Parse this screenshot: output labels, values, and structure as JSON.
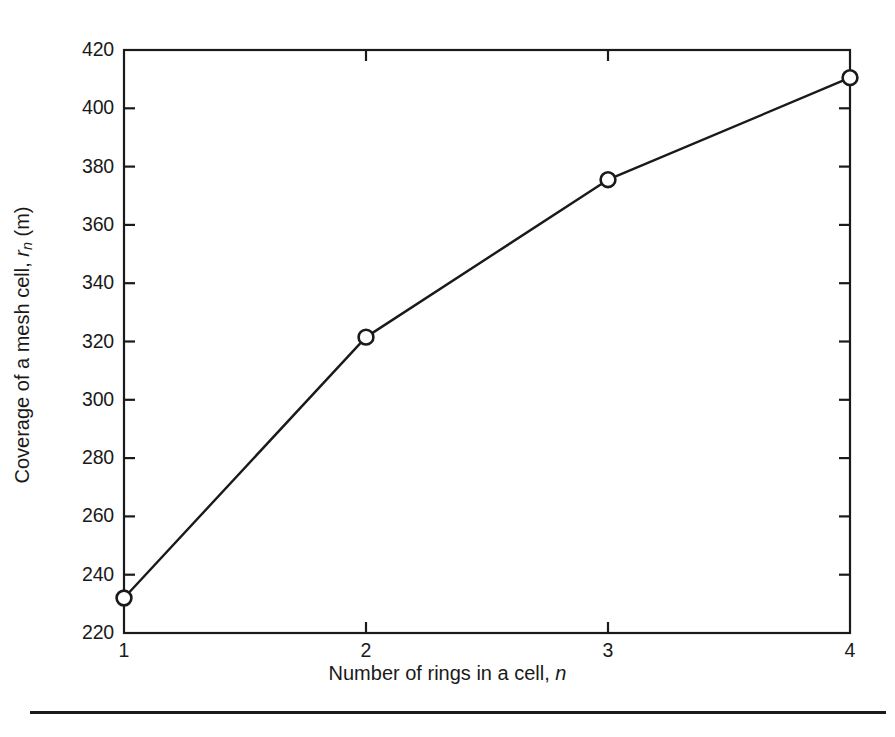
{
  "figure": {
    "background_color": "#ffffff",
    "ink_color": "#1a1a1a",
    "has_bottom_rule": true
  },
  "chart_data": {
    "type": "line",
    "title": "",
    "subtitle": "",
    "xlabel": "Number of rings in a cell, n",
    "xlabel_parts": {
      "text": "Number of rings in a cell, ",
      "variable": "n"
    },
    "ylabel": "Coverage of a mesh cell, r_n (m)",
    "ylabel_parts": {
      "text": "Coverage of a mesh cell, ",
      "variable": "r",
      "subscript": "n",
      "units": " (m)"
    },
    "x": [
      1,
      2,
      3,
      4
    ],
    "values": [
      232,
      321.5,
      375.5,
      410.5
    ],
    "series": [
      {
        "name": "Coverage of a mesh cell",
        "x": [
          1,
          2,
          3,
          4
        ],
        "values": [
          232,
          321.5,
          375.5,
          410.5
        ]
      }
    ],
    "xlim": [
      1,
      4
    ],
    "ylim": [
      220,
      420
    ],
    "xticks": [
      1,
      2,
      3,
      4
    ],
    "xtick_labels": [
      "1",
      "2",
      "3",
      "4"
    ],
    "yticks": [
      220,
      240,
      260,
      280,
      300,
      320,
      340,
      360,
      380,
      400,
      420
    ],
    "ytick_labels": [
      "220",
      "240",
      "260",
      "280",
      "300",
      "320",
      "340",
      "360",
      "380",
      "400",
      "420"
    ],
    "grid": false,
    "legend": null,
    "legend_position": "none",
    "marker": "open-circle",
    "marker_face_color": "#ffffff",
    "line_color": "#1a1a1a",
    "line_width": 2.4,
    "tick_direction": "in",
    "frame": "box"
  }
}
